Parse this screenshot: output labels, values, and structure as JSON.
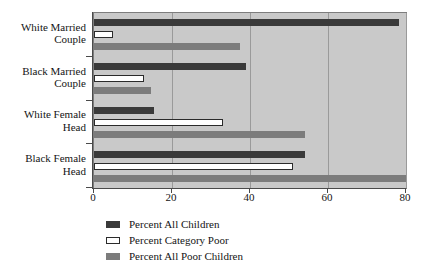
{
  "chart_data": {
    "type": "bar",
    "orientation": "horizontal",
    "title": "",
    "xlabel": "",
    "ylabel": "",
    "xlim": [
      0,
      80
    ],
    "xticks": [
      0,
      20,
      40,
      60,
      80
    ],
    "xtick_labels": [
      "0",
      "20",
      "40",
      "60",
      "80"
    ],
    "grid": true,
    "grid_axis": "x",
    "legend_position": "bottom",
    "plot_background": "#c9c9c9",
    "categories": [
      "White Married\nCouple",
      "Black Married\nCouple",
      "White Female\nHead",
      "Black Female\nHead"
    ],
    "series": [
      {
        "name": "Percent All Children",
        "color": "#3a3a3a",
        "values": [
          78.2,
          39.0,
          15.5,
          54.0
        ]
      },
      {
        "name": "Percent Category Poor",
        "color": "#ffffff",
        "values": [
          4.8,
          12.8,
          33.0,
          51.0
        ]
      },
      {
        "name": "Percent All Poor Children",
        "color": "#7c7c7c",
        "values": [
          37.4,
          14.5,
          54.0,
          80.0
        ]
      }
    ]
  },
  "legend": {
    "items": [
      {
        "label": "Percent All Children",
        "swatch": "dark-gray-filled-swatch"
      },
      {
        "label": "Percent Category Poor",
        "swatch": "white-outlined-swatch"
      },
      {
        "label": "Percent All Poor Children",
        "swatch": "medium-gray-filled-swatch"
      }
    ]
  }
}
